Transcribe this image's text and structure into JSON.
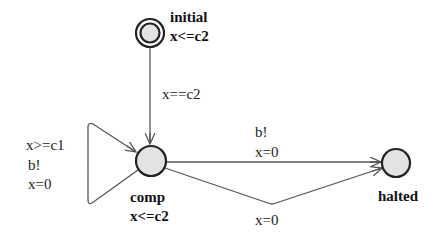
{
  "diagram": {
    "type": "timed-automaton",
    "locations": [
      {
        "id": "initial",
        "name": "initial",
        "invariant": "x<=c2",
        "is_initial": true
      },
      {
        "id": "comp",
        "name": "comp",
        "invariant": "x<=c2",
        "is_initial": false
      },
      {
        "id": "halted",
        "name": "halted",
        "invariant": "",
        "is_initial": false
      }
    ],
    "edges": [
      {
        "from": "initial",
        "to": "comp",
        "guard": "x==c2",
        "sync": "",
        "update": ""
      },
      {
        "from": "comp",
        "to": "comp",
        "guard": "x>=c1",
        "sync": "b!",
        "update": "x=0"
      },
      {
        "from": "comp",
        "to": "halted",
        "guard": "",
        "sync": "b!",
        "update": "x=0"
      },
      {
        "from": "comp",
        "to": "halted",
        "guard": "",
        "sync": "",
        "update": "x=0"
      }
    ]
  },
  "labels": {
    "initial_name": "initial",
    "initial_invariant": "x<=c2",
    "comp_name": "comp",
    "comp_invariant": "x<=c2",
    "halted_name": "halted",
    "edge_initial_comp_guard": "x==c2",
    "edge_self_guard": "x>=c1",
    "edge_self_sync": "b!",
    "edge_self_update": "x=0",
    "edge_top_sync": "b!",
    "edge_top_update": "x=0",
    "edge_bottom_update": "x=0"
  }
}
